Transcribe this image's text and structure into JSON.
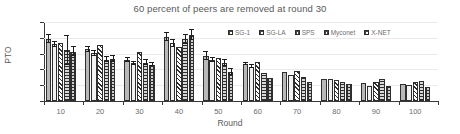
{
  "chart_data": {
    "type": "bar",
    "title": "60 percent of peers are removed at round 30",
    "xlabel": "Round",
    "ylabel": "PTO",
    "ylim": [
      0,
      10000
    ],
    "ytick_labels": [
      "0",
      "2000",
      "4000",
      "6000",
      "8000",
      "10000"
    ],
    "ytick_values": [
      0,
      2000,
      4000,
      6000,
      8000,
      10000
    ],
    "grid": true,
    "legend_position": "top-right",
    "categories": [
      "10",
      "20",
      "30",
      "40",
      "50",
      "60",
      "70",
      "80",
      "90",
      "100"
    ],
    "series": [
      {
        "name": "SG-1",
        "fill": "solid-gray",
        "values": [
          7850,
          6550,
          5200,
          8100,
          5700,
          4700,
          3700,
          2800,
          2250,
          2100
        ],
        "errors": [
          450,
          350,
          300,
          450,
          450,
          150,
          0,
          0,
          0,
          0
        ]
      },
      {
        "name": "SG-LA",
        "fill": "white",
        "values": [
          7200,
          6050,
          4800,
          7300,
          5250,
          4350,
          3250,
          2750,
          1950,
          2000
        ],
        "errors": [
          300,
          300,
          200,
          400,
          250,
          150,
          0,
          0,
          0,
          0
        ]
      },
      {
        "name": "SPS",
        "fill": "diagonal-hatch",
        "values": [
          7400,
          7050,
          6200,
          6800,
          5500,
          5000,
          3800,
          2650,
          2450,
          2450
        ]
      },
      {
        "name": "Myconet",
        "fill": "horizontal-lines",
        "values": [
          6400,
          5250,
          4850,
          7800,
          4800,
          3500,
          3050,
          2450,
          2800,
          2550
        ],
        "errors": [
          1800,
          350,
          300,
          600,
          400,
          0,
          0,
          0,
          0,
          0
        ]
      },
      {
        "name": "X-NET",
        "fill": "grid-check",
        "values": [
          6250,
          5350,
          4600,
          8350,
          3700,
          2900,
          2400,
          2100,
          1850,
          1800
        ],
        "errors": [
          550,
          350,
          200,
          600,
          350,
          0,
          0,
          0,
          0,
          0
        ]
      }
    ]
  },
  "colors": {
    "axis": "#3a3a3a",
    "grid": "#eceaea",
    "title_text": "#595959",
    "tick_text": "#6b6b6b",
    "series_solid": "#b9b9b9",
    "series_white": "#f2f2f2",
    "hatch": "#2e2e2e"
  }
}
